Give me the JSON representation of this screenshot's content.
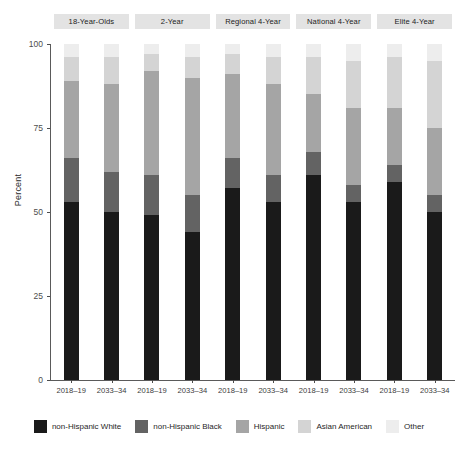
{
  "chart_data": {
    "type": "bar",
    "subtype": "stacked-bar-percent-faceted",
    "title": "",
    "subtitle": "",
    "xlabel": "",
    "ylabel": "Percent",
    "ylim": [
      0,
      100
    ],
    "yticks": [
      0,
      25,
      50,
      75,
      100
    ],
    "ytick_labels": [
      "0",
      "25",
      "50",
      "75",
      "100"
    ],
    "grid": false,
    "legend_position": "bottom",
    "stack_order_bottom_to_top": [
      "non-Hispanic White",
      "non-Hispanic Black",
      "Hispanic",
      "Asian American",
      "Other"
    ],
    "series": [
      {
        "name": "non-Hispanic White",
        "color": "#1a1a1a"
      },
      {
        "name": "non-Hispanic Black",
        "color": "#636363"
      },
      {
        "name": "Hispanic",
        "color": "#a5a5a5"
      },
      {
        "name": "Asian American",
        "color": "#d4d4d4"
      },
      {
        "name": "Other",
        "color": "#ededed"
      }
    ],
    "categories": [
      "2018-19",
      "2033-34"
    ],
    "facets": [
      {
        "label": "18-Year-Olds",
        "bars": [
          {
            "x": "2018–19",
            "values": [
              53,
              13,
              23,
              7,
              4
            ]
          },
          {
            "x": "2033–34",
            "values": [
              50,
              12,
              26,
              8,
              4
            ]
          }
        ]
      },
      {
        "label": "2-Year",
        "bars": [
          {
            "x": "2018–19",
            "values": [
              49,
              12,
              31,
              5,
              3
            ]
          },
          {
            "x": "2033–34",
            "values": [
              44,
              11,
              35,
              6,
              4
            ]
          }
        ]
      },
      {
        "label": "Regional 4-Year",
        "bars": [
          {
            "x": "2018–19",
            "values": [
              57,
              9,
              25,
              6,
              3
            ]
          },
          {
            "x": "2033–34",
            "values": [
              53,
              8,
              27,
              8,
              4
            ]
          }
        ]
      },
      {
        "label": "National 4-Year",
        "bars": [
          {
            "x": "2018–19",
            "values": [
              61,
              7,
              17,
              11,
              4
            ]
          },
          {
            "x": "2033–34",
            "values": [
              53,
              5,
              23,
              14,
              5
            ]
          }
        ]
      },
      {
        "label": "Elite 4-Year",
        "bars": [
          {
            "x": "2018–19",
            "values": [
              59,
              5,
              17,
              15,
              4
            ]
          },
          {
            "x": "2033–34",
            "values": [
              50,
              5,
              20,
              20,
              5
            ]
          }
        ]
      }
    ]
  },
  "axes": {
    "y_title": "Percent",
    "y_ticks": [
      "100",
      "75",
      "50",
      "25",
      "0"
    ],
    "x_tick_labels": [
      "2018–19",
      "2033–34"
    ]
  },
  "facet_labels": [
    "18-Year-Olds",
    "2-Year",
    "Regional 4-Year",
    "National 4-Year",
    "Elite 4-Year"
  ],
  "legend": {
    "items": [
      {
        "label": "non-Hispanic White",
        "color": "#1a1a1a"
      },
      {
        "label": "non-Hispanic Black",
        "color": "#636363"
      },
      {
        "label": "Hispanic",
        "color": "#a5a5a5"
      },
      {
        "label": "Asian American",
        "color": "#d4d4d4"
      },
      {
        "label": "Other",
        "color": "#ededed"
      }
    ]
  },
  "colors": {
    "strip_background": "#e3e3e3",
    "axis": "#5a5a5a",
    "text": "#1a1a1a",
    "panel_background": "#ffffff"
  }
}
